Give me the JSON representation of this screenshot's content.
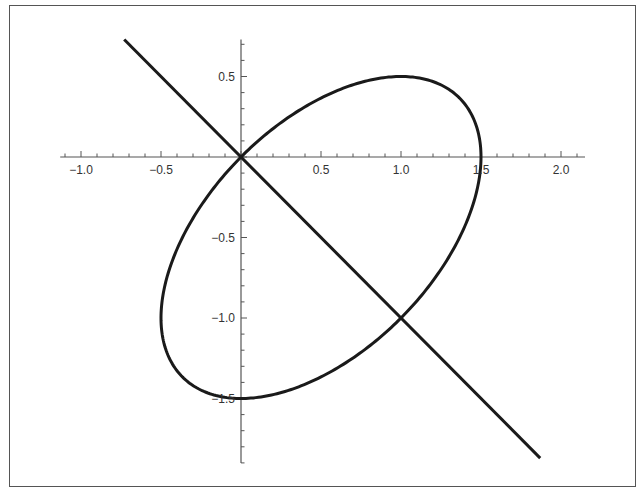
{
  "chart_data": {
    "type": "line",
    "title": "",
    "xlabel": "",
    "ylabel": "",
    "xlim": [
      -1.13,
      2.15
    ],
    "ylim": [
      -1.9,
      0.73
    ],
    "grid": false,
    "x_ticks": [
      "-1.0",
      "-0.5",
      "0.5",
      "1.0",
      "1.5",
      "2.0"
    ],
    "x_tick_values": [
      -1.0,
      -0.5,
      0.5,
      1.0,
      1.5,
      2.0
    ],
    "y_ticks": [
      "0.5",
      "-0.5",
      "-1.0",
      "-1.5"
    ],
    "y_tick_values": [
      0.5,
      -0.5,
      -1.0,
      -1.5
    ],
    "series": [
      {
        "name": "ellipse",
        "equation": "x^2 - x*y + y^2 - 1.5x + 1.5y = 0",
        "center": [
          0.5,
          -0.5
        ],
        "key_points": [
          [
            0,
            0
          ],
          [
            1.5,
            0
          ],
          [
            1,
            0.5
          ],
          [
            0,
            -1.5
          ],
          [
            1,
            -1
          ]
        ],
        "color": "#1a1a1a"
      },
      {
        "name": "line",
        "equation": "y = -x",
        "x_range": [
          -0.73,
          1.87
        ],
        "color": "#1a1a1a"
      }
    ],
    "intersections": [
      [
        0,
        0
      ],
      [
        1,
        -1
      ]
    ],
    "legend": []
  },
  "axes": {
    "color": "#555555",
    "curve_color": "#1a1a1a"
  }
}
